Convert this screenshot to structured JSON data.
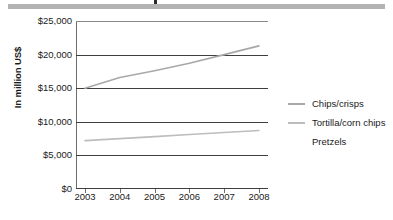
{
  "banner": {
    "name": "top-rule"
  },
  "chart_data": {
    "type": "line",
    "title": "",
    "xlabel": "",
    "ylabel": "In million US$",
    "x": [
      "2003",
      "2004",
      "2005",
      "2006",
      "2007",
      "2008"
    ],
    "ylim": [
      0,
      25000
    ],
    "ytick_labels": [
      "$25,000",
      "$20,000",
      "$15,000",
      "$10,000",
      "$5,000",
      "$0"
    ],
    "ytick_values": [
      25000,
      20000,
      15000,
      10000,
      5000,
      0
    ],
    "grid": true,
    "legend_position": "right",
    "series": [
      {
        "name": "Chips/crisps",
        "color": "#a8a8a8",
        "values": [
          15000,
          16600,
          17600,
          18700,
          20000,
          21300
        ]
      },
      {
        "name": "Tortilla/corn chips",
        "color": "#bdbdbd",
        "values": [
          7200,
          7500,
          7800,
          8100,
          8400,
          8700
        ]
      },
      {
        "name": "Pretzels",
        "color": "#ffffff",
        "values": [
          null,
          null,
          null,
          null,
          null,
          null
        ]
      }
    ]
  }
}
